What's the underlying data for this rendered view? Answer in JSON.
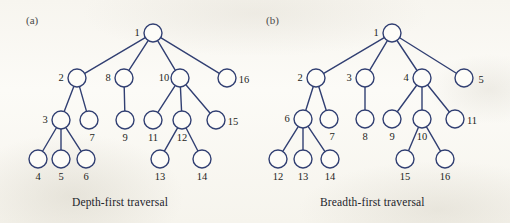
{
  "figure": {
    "background_color": "#fbfaf6",
    "stroke_color": "#313f72",
    "node_fill": "#fdfcf8",
    "text_color": "#1d1e22",
    "node_radius": 9,
    "stroke_width": 1.4
  },
  "panels": [
    {
      "tag": "(a)",
      "tag_pos": {
        "x": 26,
        "y": 14
      },
      "caption": "Depth-first traversal",
      "caption_pos": {
        "x": 72,
        "y": 196
      },
      "nodes": [
        {
          "id": "1",
          "x": 153,
          "y": 33,
          "label": "1",
          "label_pos": "left"
        },
        {
          "id": "2",
          "x": 77,
          "y": 78,
          "label": "2",
          "label_pos": "left"
        },
        {
          "id": "8",
          "x": 124,
          "y": 78,
          "label": "8",
          "label_pos": "left"
        },
        {
          "id": "10",
          "x": 180,
          "y": 78,
          "label": "10",
          "label_pos": "left"
        },
        {
          "id": "16",
          "x": 227,
          "y": 78,
          "label": "16",
          "label_pos": "right"
        },
        {
          "id": "3",
          "x": 61,
          "y": 120,
          "label": "3",
          "label_pos": "left"
        },
        {
          "id": "7",
          "x": 89,
          "y": 120,
          "label": "7",
          "label_pos": "below-right"
        },
        {
          "id": "9",
          "x": 125,
          "y": 120,
          "label": "9",
          "label_pos": "below"
        },
        {
          "id": "11",
          "x": 153,
          "y": 120,
          "label": "11",
          "label_pos": "below"
        },
        {
          "id": "12",
          "x": 182,
          "y": 120,
          "label": "12",
          "label_pos": "below"
        },
        {
          "id": "15",
          "x": 216,
          "y": 120,
          "label": "15",
          "label_pos": "right"
        },
        {
          "id": "4",
          "x": 38,
          "y": 159,
          "label": "4",
          "label_pos": "below"
        },
        {
          "id": "5",
          "x": 61,
          "y": 159,
          "label": "5",
          "label_pos": "below"
        },
        {
          "id": "6",
          "x": 86,
          "y": 159,
          "label": "6",
          "label_pos": "below"
        },
        {
          "id": "13",
          "x": 160,
          "y": 159,
          "label": "13",
          "label_pos": "below"
        },
        {
          "id": "14",
          "x": 202,
          "y": 159,
          "label": "14",
          "label_pos": "below"
        }
      ],
      "edges": [
        [
          "1",
          "2"
        ],
        [
          "1",
          "8"
        ],
        [
          "1",
          "10"
        ],
        [
          "1",
          "16"
        ],
        [
          "2",
          "3"
        ],
        [
          "2",
          "7"
        ],
        [
          "8",
          "9"
        ],
        [
          "10",
          "11"
        ],
        [
          "10",
          "12"
        ],
        [
          "10",
          "15"
        ],
        [
          "3",
          "4"
        ],
        [
          "3",
          "5"
        ],
        [
          "3",
          "6"
        ],
        [
          "12",
          "13"
        ],
        [
          "12",
          "14"
        ]
      ]
    },
    {
      "tag": "(b)",
      "tag_pos": {
        "x": 266,
        "y": 14
      },
      "caption": "Breadth-first traversal",
      "caption_pos": {
        "x": 320,
        "y": 196
      },
      "nodes": [
        {
          "id": "1",
          "x": 392,
          "y": 33,
          "label": "1",
          "label_pos": "left"
        },
        {
          "id": "2",
          "x": 316,
          "y": 78,
          "label": "2",
          "label_pos": "left"
        },
        {
          "id": "3",
          "x": 365,
          "y": 78,
          "label": "3",
          "label_pos": "left"
        },
        {
          "id": "4",
          "x": 422,
          "y": 78,
          "label": "4",
          "label_pos": "left"
        },
        {
          "id": "5",
          "x": 464,
          "y": 78,
          "label": "5",
          "label_pos": "right"
        },
        {
          "id": "6",
          "x": 303,
          "y": 119,
          "label": "6",
          "label_pos": "left"
        },
        {
          "id": "7",
          "x": 329,
          "y": 119,
          "label": "7",
          "label_pos": "below-right"
        },
        {
          "id": "8",
          "x": 365,
          "y": 119,
          "label": "8",
          "label_pos": "below"
        },
        {
          "id": "9",
          "x": 392,
          "y": 119,
          "label": "9",
          "label_pos": "below"
        },
        {
          "id": "10",
          "x": 422,
          "y": 119,
          "label": "10",
          "label_pos": "below"
        },
        {
          "id": "11",
          "x": 455,
          "y": 119,
          "label": "11",
          "label_pos": "right"
        },
        {
          "id": "12",
          "x": 278,
          "y": 159,
          "label": "12",
          "label_pos": "below"
        },
        {
          "id": "13",
          "x": 303,
          "y": 159,
          "label": "13",
          "label_pos": "below"
        },
        {
          "id": "14",
          "x": 330,
          "y": 159,
          "label": "14",
          "label_pos": "below"
        },
        {
          "id": "15",
          "x": 405,
          "y": 159,
          "label": "15",
          "label_pos": "below"
        },
        {
          "id": "16",
          "x": 445,
          "y": 159,
          "label": "16",
          "label_pos": "below"
        }
      ],
      "edges": [
        [
          "1",
          "2"
        ],
        [
          "1",
          "3"
        ],
        [
          "1",
          "4"
        ],
        [
          "1",
          "5"
        ],
        [
          "2",
          "6"
        ],
        [
          "2",
          "7"
        ],
        [
          "3",
          "8"
        ],
        [
          "4",
          "9"
        ],
        [
          "4",
          "10"
        ],
        [
          "4",
          "11"
        ],
        [
          "6",
          "12"
        ],
        [
          "6",
          "13"
        ],
        [
          "6",
          "14"
        ],
        [
          "10",
          "15"
        ],
        [
          "10",
          "16"
        ]
      ]
    }
  ]
}
